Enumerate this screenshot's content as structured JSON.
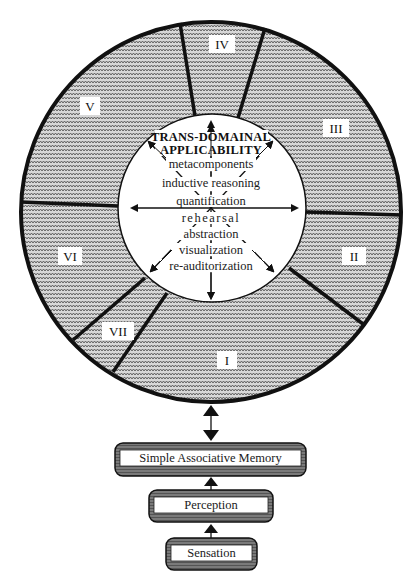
{
  "diagram": {
    "center": {
      "title_line1": "TRANS-DOMAINAL",
      "title_line2": "APPLICABILITY",
      "items": [
        "metacomponents",
        "inductive reasoning",
        "quantification",
        "rehearsal",
        "abstraction",
        "visualization",
        "re-auditorization"
      ]
    },
    "segments": [
      {
        "label": "I"
      },
      {
        "label": "II"
      },
      {
        "label": "III"
      },
      {
        "label": "IV"
      },
      {
        "label": "V"
      },
      {
        "label": "VI"
      },
      {
        "label": "VII"
      }
    ],
    "stack": [
      {
        "label": "Simple Associative Memory"
      },
      {
        "label": "Perception"
      },
      {
        "label": "Sensation"
      }
    ],
    "colors": {
      "ring_fill": "#9a9a9a",
      "outline": "#111111",
      "inner_fill": "#ffffff",
      "box_fill": "#6e6e6e"
    }
  }
}
